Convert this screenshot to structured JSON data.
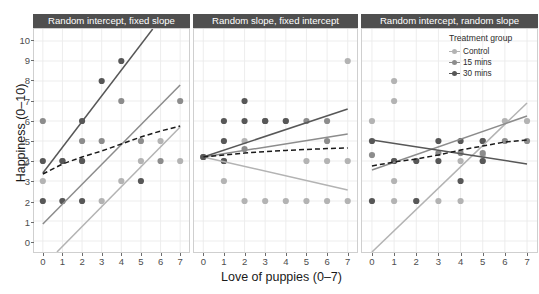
{
  "chart_data": {
    "type": "scatter",
    "title": "",
    "xlabel": "Love of puppies (0–7)",
    "ylabel": "Happiness (0–10)",
    "xlim": [
      -0.45,
      7.45
    ],
    "ylim": [
      -0.55,
      10.6
    ],
    "xticks": [
      "0",
      "1",
      "2",
      "3",
      "4",
      "5",
      "6",
      "7"
    ],
    "yticks": [
      "0",
      "1",
      "2",
      "3",
      "4",
      "5",
      "6",
      "7",
      "8",
      "9",
      "10"
    ],
    "grid": true,
    "legend": {
      "title": "Treatment group",
      "position": "top-right-inside-panel-3",
      "entries": [
        {
          "label": "Control",
          "color": "#b3b3b3"
        },
        {
          "label": "15 mins",
          "color": "#8c8c8c"
        },
        {
          "label": "30 mins",
          "color": "#575757"
        }
      ]
    },
    "overall_trend": {
      "label": "overall",
      "style": "dashed",
      "color": "#1a1a1a"
    },
    "facets": [
      {
        "title": "Random intercept, fixed slope",
        "series": [
          {
            "name": "Control",
            "color": "#b3b3b3",
            "points": [
              [
                0,
                3
              ],
              [
                1,
                2
              ],
              [
                2,
                4
              ],
              [
                3,
                2
              ],
              [
                4,
                3
              ],
              [
                5,
                4
              ],
              [
                6,
                5
              ],
              [
                7,
                4
              ]
            ],
            "fit": {
              "x0": 0.72,
              "y0": -0.55,
              "x1": 7.0,
              "y1": 5.7
            }
          },
          {
            "name": "15 mins",
            "color": "#8c8c8c",
            "points": [
              [
                0,
                6
              ],
              [
                1,
                4
              ],
              [
                2,
                5
              ],
              [
                3,
                5
              ],
              [
                4,
                7
              ],
              [
                5,
                5
              ],
              [
                6,
                4
              ],
              [
                7,
                7
              ]
            ],
            "fit": {
              "x0": 0.0,
              "y0": 0.85,
              "x1": 7.0,
              "y1": 7.8
            }
          },
          {
            "name": "30 mins",
            "color": "#575757",
            "points": [
              [
                0,
                4
              ],
              [
                0,
                2
              ],
              [
                1,
                4
              ],
              [
                1,
                2
              ],
              [
                2,
                6
              ],
              [
                2,
                4
              ],
              [
                2,
                2
              ],
              [
                3,
                8
              ],
              [
                4,
                9
              ],
              [
                5,
                3
              ]
            ],
            "fit": {
              "x0": 0.0,
              "y0": 3.4,
              "x1": 5.6,
              "y1": 10.6
            }
          }
        ],
        "overall_fit": [
          [
            0.0,
            3.35
          ],
          [
            1.0,
            3.85
          ],
          [
            2.0,
            4.2
          ],
          [
            3.0,
            4.5
          ],
          [
            4.0,
            4.85
          ],
          [
            5.0,
            5.2
          ],
          [
            6.0,
            5.5
          ],
          [
            7.0,
            5.75
          ]
        ]
      },
      {
        "title": "Random slope, fixed intercept",
        "series": [
          {
            "name": "Control",
            "color": "#b3b3b3",
            "points": [
              [
                0,
                4.2
              ],
              [
                1,
                3
              ],
              [
                2,
                5
              ],
              [
                2,
                2
              ],
              [
                3,
                6
              ],
              [
                3,
                2
              ],
              [
                4,
                6
              ],
              [
                4,
                2
              ],
              [
                5,
                4
              ],
              [
                5,
                2
              ],
              [
                6,
                4
              ],
              [
                6,
                2
              ],
              [
                7,
                9
              ],
              [
                7,
                4
              ],
              [
                7,
                2
              ]
            ],
            "fit": {
              "x0": 0.0,
              "y0": 4.2,
              "x1": 7.0,
              "y1": 2.55
            }
          },
          {
            "name": "15 mins",
            "color": "#8c8c8c",
            "points": [
              [
                0,
                4.2
              ],
              [
                1,
                4
              ],
              [
                2,
                4.6
              ],
              [
                3,
                6
              ],
              [
                5,
                6
              ],
              [
                6,
                5
              ],
              [
                6,
                6
              ]
            ],
            "fit": {
              "x0": 0.0,
              "y0": 4.2,
              "x1": 7.0,
              "y1": 5.35
            }
          },
          {
            "name": "30 mins",
            "color": "#575757",
            "points": [
              [
                0,
                4.2
              ],
              [
                1,
                4
              ],
              [
                1,
                5
              ],
              [
                1,
                6
              ],
              [
                2,
                7
              ],
              [
                2,
                6
              ],
              [
                3,
                6
              ],
              [
                4,
                6
              ]
            ],
            "fit": {
              "x0": 0.0,
              "y0": 4.2,
              "x1": 7.0,
              "y1": 6.6
            }
          }
        ],
        "overall_fit": [
          [
            0.0,
            4.2
          ],
          [
            1.0,
            4.3
          ],
          [
            2.0,
            4.4
          ],
          [
            3.0,
            4.47
          ],
          [
            4.0,
            4.53
          ],
          [
            5.0,
            4.58
          ],
          [
            6.0,
            4.62
          ],
          [
            7.0,
            4.65
          ]
        ]
      },
      {
        "title": "Random intercept, random slope",
        "series": [
          {
            "name": "Control",
            "color": "#b3b3b3",
            "points": [
              [
                0,
                6
              ],
              [
                1,
                8
              ],
              [
                1,
                7
              ],
              [
                1,
                3
              ],
              [
                1,
                2
              ],
              [
                2,
                2
              ],
              [
                3,
                2
              ],
              [
                4,
                4
              ],
              [
                4,
                2
              ],
              [
                5,
                4
              ],
              [
                5,
                4.3
              ],
              [
                6,
                6
              ],
              [
                7,
                6
              ]
            ],
            "fit": {
              "x0": 0.0,
              "y0": -0.55,
              "x1": 7.0,
              "y1": 6.9
            }
          },
          {
            "name": "15 mins",
            "color": "#8c8c8c",
            "points": [
              [
                0,
                4.3
              ],
              [
                1,
                4
              ],
              [
                3,
                4.4
              ],
              [
                4,
                4.4
              ],
              [
                5,
                4.4
              ],
              [
                5,
                5
              ],
              [
                6,
                5
              ],
              [
                7,
                5
              ]
            ],
            "fit": {
              "x0": 0.0,
              "y0": 3.55,
              "x1": 7.0,
              "y1": 6.25
            }
          },
          {
            "name": "30 mins",
            "color": "#575757",
            "points": [
              [
                0,
                5
              ],
              [
                0,
                2
              ],
              [
                1,
                4
              ],
              [
                2,
                4
              ],
              [
                2,
                2
              ],
              [
                3,
                5
              ],
              [
                3,
                4
              ],
              [
                4,
                3
              ],
              [
                4,
                5
              ],
              [
                5,
                5
              ],
              [
                5,
                4
              ]
            ],
            "fit": {
              "x0": 0.0,
              "y0": 5.05,
              "x1": 7.0,
              "y1": 3.85
            }
          }
        ],
        "overall_fit": [
          [
            0.0,
            3.75
          ],
          [
            1.0,
            3.95
          ],
          [
            2.0,
            4.1
          ],
          [
            3.0,
            4.3
          ],
          [
            4.0,
            4.55
          ],
          [
            5.0,
            4.75
          ],
          [
            6.0,
            4.95
          ],
          [
            7.0,
            5.05
          ]
        ]
      }
    ]
  },
  "style": {
    "strip_bg": "#4f4f4f",
    "strip_fg": "#ffffff",
    "panel_bg": "#ffffff",
    "grid_color": "#ebebeb",
    "axis_text": "#4d4d4d",
    "dashed_color": "#1a1a1a"
  }
}
